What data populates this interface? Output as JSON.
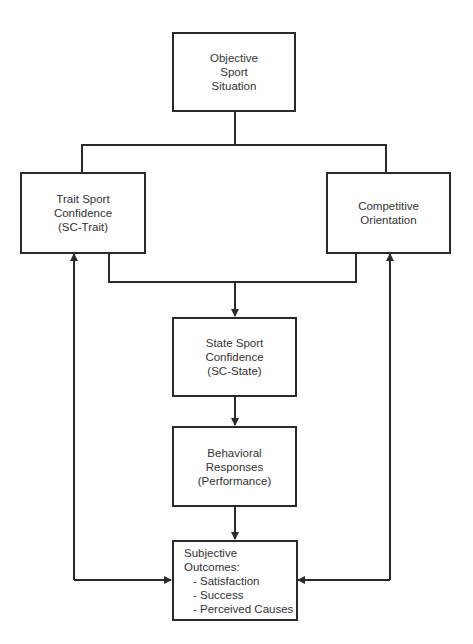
{
  "diagram": {
    "nodes": {
      "objective": {
        "lines": [
          "Objective",
          "Sport",
          "Situation"
        ]
      },
      "trait": {
        "lines": [
          "Trait Sport",
          "Confidence",
          "(SC-Trait)"
        ]
      },
      "competitive": {
        "lines": [
          "Competitive",
          "Orientation"
        ]
      },
      "state": {
        "lines": [
          "State Sport",
          "Confidence",
          "(SC-State)"
        ]
      },
      "behavioral": {
        "lines": [
          "Behavioral",
          "Responses",
          "(Performance)"
        ]
      },
      "subjective": {
        "lines": [
          "Subjective",
          "Outcomes:"
        ],
        "items": [
          "- Satisfaction",
          "- Success",
          "- Perceived Causes"
        ]
      }
    },
    "edges": [
      {
        "from": "objective",
        "to": "trait"
      },
      {
        "from": "objective",
        "to": "competitive"
      },
      {
        "from": "trait",
        "to": "state"
      },
      {
        "from": "competitive",
        "to": "state"
      },
      {
        "from": "state",
        "to": "behavioral"
      },
      {
        "from": "behavioral",
        "to": "subjective"
      },
      {
        "from": "subjective",
        "to": "trait"
      },
      {
        "from": "subjective",
        "to": "competitive"
      }
    ],
    "colors": {
      "line": "#2a2a2a",
      "text": "#333333",
      "background": "#ffffff"
    }
  }
}
